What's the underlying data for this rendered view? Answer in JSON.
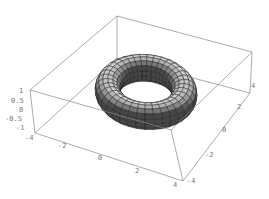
{
  "chart_data": {
    "type": "surface3d",
    "title": "",
    "surface": "torus",
    "parametric": {
      "major_radius": 3,
      "minor_radius": 1,
      "x": "(3 + cos v) cos u",
      "y": "(3 + cos v) sin u",
      "z": "sin v"
    },
    "mesh": {
      "u_segments": 36,
      "v_segments": 16
    },
    "shading": "grayscale",
    "axes": {
      "x": {
        "ticks": [
          "-2",
          "0",
          "2",
          "4"
        ],
        "range": [
          -4,
          4
        ]
      },
      "y": {
        "ticks": [
          "-4",
          "-2",
          "0",
          "2",
          "4"
        ],
        "range": [
          -4,
          4
        ]
      },
      "z": {
        "ticks": [
          "1",
          "0.5",
          "0",
          "-0.5",
          "-1"
        ],
        "range": [
          -1,
          1
        ]
      },
      "extra_tick": "-4"
    },
    "box": true,
    "grid": false,
    "legend": null
  },
  "labels": {
    "z": [
      "1",
      "0.5",
      "0",
      "-0.5",
      "-1"
    ],
    "z_corner": "-4",
    "x": [
      "-2",
      "0",
      "2",
      "4"
    ],
    "y": [
      "-4",
      "-2",
      "0",
      "2",
      "4"
    ]
  }
}
